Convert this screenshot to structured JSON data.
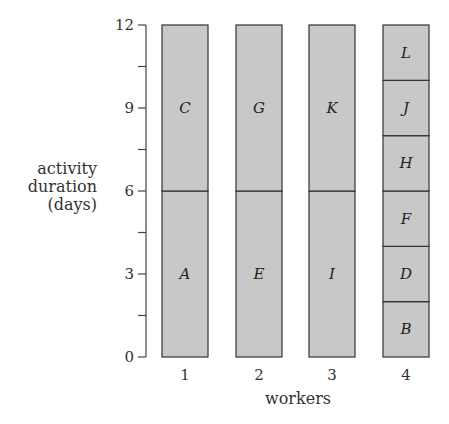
{
  "chart_data": {
    "type": "bar",
    "stacked": true,
    "title": "",
    "xlabel": "workers",
    "ylabel": [
      "activity",
      "duration",
      "(days)"
    ],
    "ylim": [
      0,
      12
    ],
    "yticks": [
      0,
      3,
      6,
      9,
      12
    ],
    "minor_ytick_step": 1.5,
    "grid": false,
    "categories": [
      "1",
      "2",
      "3",
      "4"
    ],
    "bar_color": "#c8c8c8",
    "bars": [
      {
        "worker": "1",
        "segments": [
          {
            "activity": "A",
            "start": 0,
            "duration": 6
          },
          {
            "activity": "C",
            "start": 6,
            "duration": 6
          }
        ]
      },
      {
        "worker": "2",
        "segments": [
          {
            "activity": "E",
            "start": 0,
            "duration": 6
          },
          {
            "activity": "G",
            "start": 6,
            "duration": 6
          }
        ]
      },
      {
        "worker": "3",
        "segments": [
          {
            "activity": "I",
            "start": 0,
            "duration": 6
          },
          {
            "activity": "K",
            "start": 6,
            "duration": 6
          }
        ]
      },
      {
        "worker": "4",
        "segments": [
          {
            "activity": "B",
            "start": 0,
            "duration": 2
          },
          {
            "activity": "D",
            "start": 2,
            "duration": 2
          },
          {
            "activity": "F",
            "start": 4,
            "duration": 2
          },
          {
            "activity": "H",
            "start": 6,
            "duration": 2
          },
          {
            "activity": "J",
            "start": 8,
            "duration": 2
          },
          {
            "activity": "L",
            "start": 10,
            "duration": 2
          }
        ]
      }
    ]
  }
}
